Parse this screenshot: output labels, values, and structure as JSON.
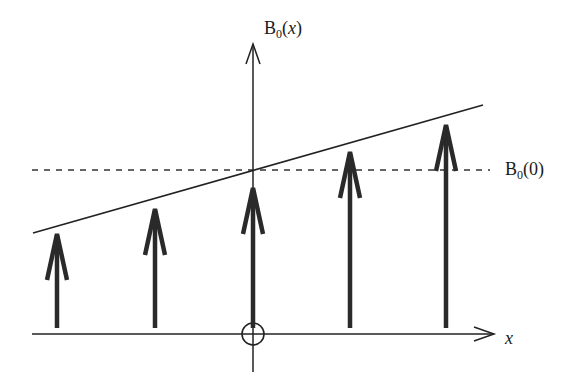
{
  "diagram": {
    "y_axis_label": {
      "main": "B",
      "sub": "0",
      "arg": "x"
    },
    "x_axis_label": "x",
    "reference_label": {
      "main": "B",
      "sub": "0",
      "arg": "0"
    },
    "origin_marker": "circle-at-origin",
    "colors": {
      "stroke": "#222222",
      "background": "#ffffff"
    },
    "arrows": [
      {
        "x": 57,
        "tip_y": 232
      },
      {
        "x": 155,
        "tip_y": 207
      },
      {
        "x": 253,
        "tip_y": 186
      },
      {
        "x": 350,
        "tip_y": 150
      },
      {
        "x": 446,
        "tip_y": 123
      }
    ],
    "gradient_line": {
      "x1": 33,
      "y1": 233,
      "x2": 483,
      "y2": 105
    },
    "reference_line": {
      "y": 170,
      "x1": 32,
      "x2": 490,
      "style": "dashed"
    }
  }
}
